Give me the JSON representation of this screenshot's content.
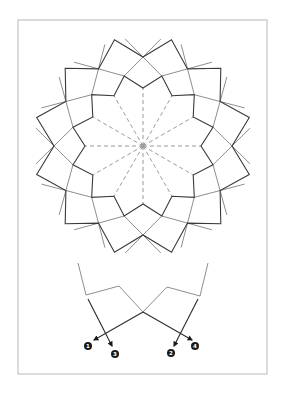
{
  "figure": {
    "frame": {
      "x": 18,
      "y": 20,
      "width": 249,
      "height": 354
    },
    "colors": {
      "outline_dark": "#3a3a3a",
      "construction_gray": "#8e8e8e",
      "dashed_gray": "#9a9a9a",
      "frame": "#b8b8b8",
      "label_fill": "#1a1a1a",
      "label_text": "#ffffff"
    }
  },
  "rosette": {
    "center": [
      143,
      146
    ],
    "folds": 12,
    "tip_radius": 110,
    "crossing_radius": 89,
    "mid_radius": 72.5,
    "inner_radius": 58,
    "tip_angle_offset_deg": 15
  },
  "detail": {
    "gray_lines": [
      [
        [
          78,
          263
        ],
        [
          86,
          295
        ],
        [
          119,
          286
        ],
        [
          143,
          312
        ],
        [
          167,
          287
        ],
        [
          200,
          296
        ],
        [
          208,
          263
        ]
      ]
    ],
    "arrows": [
      {
        "id": "1",
        "from": [
          143,
          312
        ],
        "to": [
          94,
          340
        ],
        "label_pos": [
          88,
          346
        ]
      },
      {
        "id": "2",
        "from": [
          198,
          299
        ],
        "to": [
          174,
          346
        ],
        "label_pos": [
          171,
          353
        ]
      },
      {
        "id": "3",
        "from": [
          88,
          299
        ],
        "to": [
          112,
          346
        ],
        "label_pos": [
          115,
          354
        ]
      },
      {
        "id": "4",
        "from": [
          143,
          312
        ],
        "to": [
          192,
          340
        ],
        "label_pos": [
          195,
          346
        ]
      }
    ],
    "labels": [
      "1",
      "2",
      "3",
      "4"
    ]
  }
}
